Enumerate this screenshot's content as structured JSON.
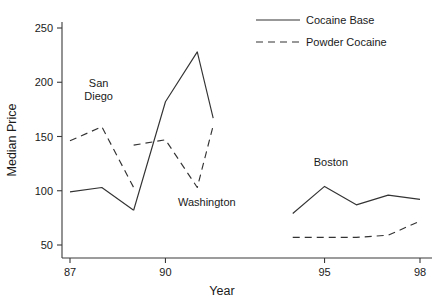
{
  "chart_data": {
    "type": "line",
    "title": "",
    "xlabel": "Year",
    "ylabel": "Median Price",
    "xlim": [
      86.65,
      99.0
    ],
    "ylim": [
      44,
      262
    ],
    "xticks": [
      87,
      90,
      95,
      98
    ],
    "xtick_labels": [
      "87",
      "90",
      "95",
      "98"
    ],
    "yticks": [
      50,
      100,
      150,
      200,
      250
    ],
    "ytick_labels": [
      "50",
      "100",
      "150",
      "200",
      "250"
    ],
    "grid": false,
    "legend_position": "top-right",
    "legend": [
      {
        "name": "Cocaine Base",
        "style": "solid"
      },
      {
        "name": "Powder Cocaine",
        "style": "dashed"
      }
    ],
    "annotations": [
      {
        "text": "San",
        "x": 87.9,
        "y": 196
      },
      {
        "text": "Diego",
        "x": 87.9,
        "y": 184
      },
      {
        "text": "Washington",
        "x": 91.3,
        "y": 86
      },
      {
        "text": "Boston",
        "x": 95.2,
        "y": 123
      }
    ],
    "groups": [
      {
        "label": "San Diego",
        "series": [
          {
            "name": "Cocaine Base",
            "style": "solid",
            "x": [
              87.0,
              88.0,
              89.0
            ],
            "values": [
              99,
              103,
              82
            ]
          },
          {
            "name": "Powder Cocaine",
            "style": "dashed",
            "x": [
              87.0,
              88.0,
              89.0
            ],
            "values": [
              146,
              159,
              103
            ]
          }
        ]
      },
      {
        "label": "Washington",
        "series": [
          {
            "name": "Cocaine Base",
            "style": "solid",
            "x": [
              89.0,
              90.0,
              91.0,
              91.5
            ],
            "values": [
              82,
              182,
              228,
              167
            ]
          },
          {
            "name": "Powder Cocaine",
            "style": "dashed",
            "x": [
              89.0,
              90.0,
              91.0,
              91.5
            ],
            "values": [
              142,
              147,
              103,
              160
            ]
          }
        ]
      },
      {
        "label": "Boston",
        "series": [
          {
            "name": "Cocaine Base",
            "style": "solid",
            "x": [
              94.0,
              95.0,
              96.0,
              97.0,
              98.0
            ],
            "values": [
              79,
              104,
              87,
              96,
              92
            ]
          },
          {
            "name": "Powder Cocaine",
            "style": "dashed",
            "x": [
              94.0,
              95.0,
              96.0,
              97.0,
              98.0
            ],
            "values": [
              57,
              57,
              57,
              59,
              72
            ]
          }
        ]
      }
    ]
  },
  "colors": {
    "line": "#333333",
    "axis": "#3a3a3a",
    "text": "#1a1a1a",
    "background": "#ffffff"
  }
}
